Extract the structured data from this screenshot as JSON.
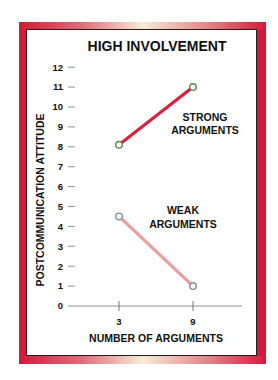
{
  "chart_data": {
    "type": "line",
    "title": "HIGH INVOLVEMENT",
    "xlabel": "NUMBER OF ARGUMENTS",
    "ylabel": "POSTCOMMUNICATION ATTITUDE",
    "x": [
      3,
      9
    ],
    "x_tick_labels": [
      "3",
      "9"
    ],
    "y_ticks": [
      0,
      1,
      2,
      3,
      4,
      5,
      6,
      7,
      8,
      9,
      10,
      11,
      12
    ],
    "ylim": [
      0,
      12
    ],
    "grid": false,
    "legend_position": "inline labels",
    "series": [
      {
        "name": "STRONG ARGUMENTS",
        "label_lines": [
          "STRONG",
          "ARGUMENTS"
        ],
        "values": [
          8.1,
          11.0
        ],
        "color": "#d9213f",
        "marker_color": "#5e8a4e"
      },
      {
        "name": "WEAK ARGUMENTS",
        "label_lines": [
          "WEAK",
          "ARGUMENTS"
        ],
        "values": [
          4.5,
          1.0
        ],
        "color": "#ec9e9e",
        "marker_color": "#8a8a9e"
      }
    ]
  },
  "frame": {
    "border_color": "#d41a3a",
    "inner_line_color": "#2a1a1a"
  }
}
